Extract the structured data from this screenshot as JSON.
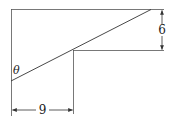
{
  "diagram": {
    "type": "geometry-figure",
    "labels": {
      "angle": "θ",
      "vertical_dimension": "6",
      "horizontal_dimension": "9"
    },
    "colors": {
      "line": "#333333",
      "background": "#ffffff"
    }
  }
}
